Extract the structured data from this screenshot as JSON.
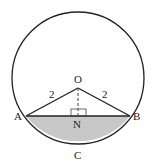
{
  "diagram": {
    "type": "circle-segment",
    "circle": {
      "cx": 78,
      "cy": 78,
      "r": 66
    },
    "colors": {
      "stroke": "#222222",
      "segment_fill": "#c8c8c8",
      "background": "#ffffff"
    },
    "points": {
      "O": {
        "label": "O",
        "x": 78,
        "y": 88
      },
      "A": {
        "label": "A",
        "x": 26,
        "y": 116
      },
      "B": {
        "label": "B",
        "x": 130,
        "y": 116
      },
      "N": {
        "label": "N",
        "x": 78,
        "y": 116
      },
      "C": {
        "label": "C",
        "x": 78,
        "y": 145
      }
    },
    "edge_labels": {
      "OA": "2",
      "OB": "2"
    },
    "annotations": {
      "right_angle_at": "N",
      "dashed_segment": "ON",
      "shaded_region": "minor segment ACB"
    }
  }
}
